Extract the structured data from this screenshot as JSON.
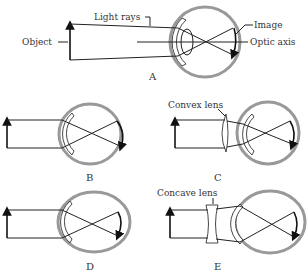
{
  "figure": {
    "panels": [
      {
        "id": "A",
        "caption": "A",
        "labels": {
          "light_rays": "Light rays",
          "object": "Object",
          "image": "Image",
          "optic_axis": "Optic axis"
        }
      },
      {
        "id": "B",
        "caption": "B"
      },
      {
        "id": "C",
        "caption": "C",
        "labels": {
          "lens": "Convex lens"
        }
      },
      {
        "id": "D",
        "caption": "D"
      },
      {
        "id": "E",
        "caption": "E",
        "labels": {
          "lens": "Concave lens"
        }
      }
    ]
  },
  "colors": {
    "eyeball": "#999999",
    "lines": "#222222"
  }
}
